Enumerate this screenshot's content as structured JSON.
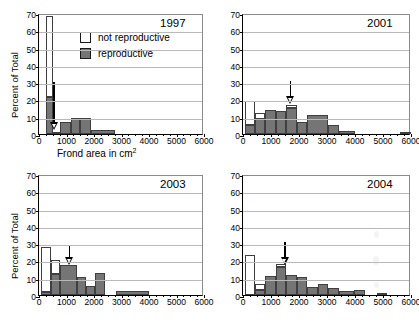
{
  "figure": {
    "axis_label_x": "Frond area in cm",
    "axis_label_x_sup": "2",
    "axis_label_y": "Percent of Total"
  },
  "legend": {
    "items": [
      {
        "key": "nonrepro",
        "label": "not reproductive",
        "color": "#ffffff"
      },
      {
        "key": "repro",
        "label": "reproductive",
        "color": "#757575"
      }
    ]
  },
  "chart_data": [
    {
      "type": "bar",
      "title": "1997",
      "xlabel": "Frond area in cm2",
      "ylabel": "Percent of Total",
      "xlim": [
        0,
        6000
      ],
      "ylim": [
        0,
        70
      ],
      "yticks": [
        0,
        10,
        20,
        30,
        40,
        50,
        60,
        70
      ],
      "xticks": [
        0,
        1000,
        2000,
        3000,
        4000,
        5000,
        6000
      ],
      "grid": true,
      "bin_width": 250,
      "stacked": true,
      "annotation_arrow_x": 550,
      "bins": [
        {
          "x0": 250,
          "x1": 500,
          "reproductive": 21.5,
          "not_reproductive": 46.5,
          "total": 68.0
        },
        {
          "x0": 500,
          "x1": 750,
          "reproductive": 1.2,
          "not_reproductive": 0.0,
          "total": 1.2
        },
        {
          "x0": 750,
          "x1": 1150,
          "reproductive": 7.0,
          "not_reproductive": 0.0,
          "total": 7.0
        },
        {
          "x0": 1150,
          "x1": 1500,
          "reproductive": 9.4,
          "not_reproductive": 0.0,
          "total": 9.4
        },
        {
          "x0": 1500,
          "x1": 1900,
          "reproductive": 9.4,
          "not_reproductive": 0.0,
          "total": 9.4
        },
        {
          "x0": 1900,
          "x1": 2750,
          "reproductive": 2.4,
          "not_reproductive": 0.0,
          "total": 2.4
        }
      ]
    },
    {
      "type": "bar",
      "title": "2001",
      "xlabel": "Frond area in cm2",
      "ylabel": "Percent of Total",
      "xlim": [
        0,
        6000
      ],
      "ylim": [
        0,
        70
      ],
      "yticks": [
        0,
        10,
        20,
        30,
        40,
        50,
        60,
        70
      ],
      "xticks": [
        0,
        1000,
        2000,
        3000,
        4000,
        5000,
        6000
      ],
      "grid": true,
      "stacked": true,
      "annotation_arrow_x": 1700,
      "bins": [
        {
          "x0": 60,
          "x1": 430,
          "reproductive": 5.0,
          "not_reproductive": 14.0,
          "total": 19.0
        },
        {
          "x0": 430,
          "x1": 800,
          "reproductive": 8.4,
          "not_reproductive": 3.6,
          "total": 12.0
        },
        {
          "x0": 800,
          "x1": 1180,
          "reproductive": 13.8,
          "not_reproductive": 0.0,
          "total": 13.8
        },
        {
          "x0": 1180,
          "x1": 1550,
          "reproductive": 13.3,
          "not_reproductive": 0.0,
          "total": 13.3
        },
        {
          "x0": 1550,
          "x1": 1930,
          "reproductive": 14.8,
          "not_reproductive": 2.0,
          "total": 16.8
        },
        {
          "x0": 1930,
          "x1": 2300,
          "reproductive": 7.0,
          "not_reproductive": 0.0,
          "total": 7.0
        },
        {
          "x0": 2300,
          "x1": 3050,
          "reproductive": 11.0,
          "not_reproductive": 0.0,
          "total": 11.0
        },
        {
          "x0": 3050,
          "x1": 3430,
          "reproductive": 5.0,
          "not_reproductive": 0.0,
          "total": 5.0
        },
        {
          "x0": 3430,
          "x1": 4000,
          "reproductive": 1.5,
          "not_reproductive": 0.0,
          "total": 1.5
        },
        {
          "x0": 5620,
          "x1": 6000,
          "reproductive": 0.9,
          "not_reproductive": 0.0,
          "total": 0.9
        }
      ]
    },
    {
      "type": "bar",
      "title": "2003",
      "xlabel": "Frond area in cm2",
      "ylabel": "Percent of Total",
      "xlim": [
        0,
        6000
      ],
      "ylim": [
        0,
        70
      ],
      "yticks": [
        0,
        10,
        20,
        30,
        40,
        50,
        60,
        70
      ],
      "xticks": [
        0,
        1000,
        2000,
        3000,
        4000,
        5000,
        6000
      ],
      "grid": true,
      "stacked": true,
      "annotation_arrow_x": 1100,
      "bins": [
        {
          "x0": 60,
          "x1": 420,
          "reproductive": 1.8,
          "not_reproductive": 26.2,
          "total": 28.0
        },
        {
          "x0": 420,
          "x1": 780,
          "reproductive": 12.0,
          "not_reproductive": 8.0,
          "total": 20.0
        },
        {
          "x0": 780,
          "x1": 1380,
          "reproductive": 17.3,
          "not_reproductive": 0.0,
          "total": 17.3
        },
        {
          "x0": 1380,
          "x1": 1700,
          "reproductive": 10.3,
          "not_reproductive": 0.0,
          "total": 10.3
        },
        {
          "x0": 1700,
          "x1": 2050,
          "reproductive": 5.0,
          "not_reproductive": 0.0,
          "total": 5.0
        },
        {
          "x0": 2050,
          "x1": 2400,
          "reproductive": 12.5,
          "not_reproductive": 0.0,
          "total": 12.5
        },
        {
          "x0": 2800,
          "x1": 4000,
          "reproductive": 2.5,
          "not_reproductive": 0.0,
          "total": 2.5
        }
      ]
    },
    {
      "type": "bar",
      "title": "2004",
      "xlabel": "Frond area in cm2",
      "ylabel": "Percent of Total",
      "xlim": [
        0,
        6000
      ],
      "ylim": [
        0,
        70
      ],
      "yticks": [
        0,
        10,
        20,
        30,
        40,
        50,
        60,
        70
      ],
      "xticks": [
        0,
        1000,
        2000,
        3000,
        4000,
        5000,
        6000
      ],
      "grid": true,
      "stacked": true,
      "annotation_arrow_x": 1500,
      "bins": [
        {
          "x0": 60,
          "x1": 430,
          "reproductive": 0.0,
          "not_reproductive": 23.0,
          "total": 23.0
        },
        {
          "x0": 430,
          "x1": 800,
          "reproductive": 2.7,
          "not_reproductive": 3.8,
          "total": 6.5
        },
        {
          "x0": 800,
          "x1": 1180,
          "reproductive": 11.2,
          "not_reproductive": 0.0,
          "total": 11.2
        },
        {
          "x0": 1180,
          "x1": 1550,
          "reproductive": 16.2,
          "not_reproductive": 1.8,
          "total": 18.0
        },
        {
          "x0": 1550,
          "x1": 1930,
          "reproductive": 11.3,
          "not_reproductive": 0.0,
          "total": 11.3
        },
        {
          "x0": 1930,
          "x1": 2300,
          "reproductive": 10.5,
          "not_reproductive": 0.0,
          "total": 10.5
        },
        {
          "x0": 2300,
          "x1": 2680,
          "reproductive": 4.8,
          "not_reproductive": 0.0,
          "total": 4.8
        },
        {
          "x0": 2680,
          "x1": 3050,
          "reproductive": 6.5,
          "not_reproductive": 0.0,
          "total": 6.5
        },
        {
          "x0": 3050,
          "x1": 3430,
          "reproductive": 3.8,
          "not_reproductive": 0.0,
          "total": 3.8
        },
        {
          "x0": 3430,
          "x1": 3980,
          "reproductive": 2.2,
          "not_reproductive": 0.0,
          "total": 2.2
        },
        {
          "x0": 3980,
          "x1": 4350,
          "reproductive": 3.0,
          "not_reproductive": 0.0,
          "total": 3.0
        },
        {
          "x0": 4800,
          "x1": 5150,
          "reproductive": 1.2,
          "not_reproductive": 0.0,
          "total": 1.2
        }
      ]
    }
  ]
}
